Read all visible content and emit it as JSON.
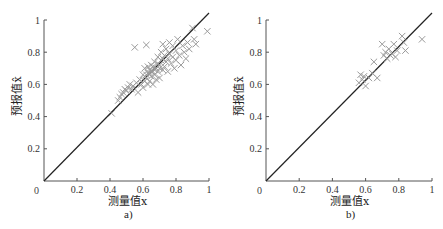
{
  "chart_data": [
    {
      "type": "scatter",
      "panel": "a)",
      "xlabel": "测量值x",
      "ylabel": "预报值x̂",
      "xlim": [
        0,
        1
      ],
      "ylim": [
        0,
        1
      ],
      "xticks": [
        "0",
        "0.2",
        "0.4",
        "0.6",
        "0.8",
        "1"
      ],
      "yticks": [
        "0.2",
        "0.4",
        "0.6",
        "0.8",
        "1"
      ],
      "reference_line": {
        "from": [
          0,
          0
        ],
        "to": [
          1,
          1
        ],
        "label": "y = x"
      },
      "marker": "x",
      "marker_color": "#9a9a9a",
      "grid": false,
      "points": [
        [
          0.41,
          0.42
        ],
        [
          0.45,
          0.5
        ],
        [
          0.46,
          0.52
        ],
        [
          0.47,
          0.54
        ],
        [
          0.48,
          0.55
        ],
        [
          0.49,
          0.57
        ],
        [
          0.5,
          0.56
        ],
        [
          0.51,
          0.58
        ],
        [
          0.52,
          0.6
        ],
        [
          0.53,
          0.57
        ],
        [
          0.54,
          0.59
        ],
        [
          0.55,
          0.83
        ],
        [
          0.56,
          0.61
        ],
        [
          0.57,
          0.55
        ],
        [
          0.58,
          0.63
        ],
        [
          0.59,
          0.6
        ],
        [
          0.6,
          0.58
        ],
        [
          0.6,
          0.66
        ],
        [
          0.61,
          0.62
        ],
        [
          0.61,
          0.7
        ],
        [
          0.62,
          0.845
        ],
        [
          0.62,
          0.64
        ],
        [
          0.63,
          0.67
        ],
        [
          0.63,
          0.6
        ],
        [
          0.64,
          0.69
        ],
        [
          0.64,
          0.62
        ],
        [
          0.65,
          0.72
        ],
        [
          0.65,
          0.65
        ],
        [
          0.66,
          0.68
        ],
        [
          0.66,
          0.6
        ],
        [
          0.67,
          0.74
        ],
        [
          0.67,
          0.66
        ],
        [
          0.68,
          0.7
        ],
        [
          0.68,
          0.63
        ],
        [
          0.69,
          0.77
        ],
        [
          0.69,
          0.68
        ],
        [
          0.7,
          0.72
        ],
        [
          0.7,
          0.64
        ],
        [
          0.71,
          0.8
        ],
        [
          0.71,
          0.75
        ],
        [
          0.72,
          0.69
        ],
        [
          0.72,
          0.85
        ],
        [
          0.73,
          0.78
        ],
        [
          0.73,
          0.71
        ],
        [
          0.74,
          0.82
        ],
        [
          0.74,
          0.74
        ],
        [
          0.75,
          0.76
        ],
        [
          0.75,
          0.68
        ],
        [
          0.76,
          0.86
        ],
        [
          0.76,
          0.79
        ],
        [
          0.77,
          0.73
        ],
        [
          0.78,
          0.84
        ],
        [
          0.78,
          0.77
        ],
        [
          0.79,
          0.7
        ],
        [
          0.8,
          0.81
        ],
        [
          0.8,
          0.75
        ],
        [
          0.81,
          0.88
        ],
        [
          0.82,
          0.78
        ],
        [
          0.83,
          0.72
        ],
        [
          0.84,
          0.84
        ],
        [
          0.85,
          0.8
        ],
        [
          0.86,
          0.76
        ],
        [
          0.87,
          0.86
        ],
        [
          0.88,
          0.82
        ],
        [
          0.9,
          0.95
        ],
        [
          0.91,
          0.88
        ],
        [
          0.92,
          0.85
        ],
        [
          0.99,
          0.93
        ],
        [
          0.62,
          0.66
        ],
        [
          0.64,
          0.67
        ],
        [
          0.66,
          0.71
        ],
        [
          0.67,
          0.69
        ],
        [
          0.69,
          0.73
        ],
        [
          0.7,
          0.7
        ],
        [
          0.72,
          0.76
        ],
        [
          0.63,
          0.71
        ],
        [
          0.65,
          0.68
        ]
      ]
    },
    {
      "type": "scatter",
      "panel": "b)",
      "xlabel": "测量值x",
      "ylabel": "预报值x̂",
      "xlim": [
        0,
        1
      ],
      "ylim": [
        0,
        1
      ],
      "xticks": [
        "0",
        "0.2",
        "0.4",
        "0.6",
        "0.8",
        "1"
      ],
      "yticks": [
        "0.2",
        "0.4",
        "0.6",
        "0.8",
        "1"
      ],
      "reference_line": {
        "from": [
          0,
          0
        ],
        "to": [
          1,
          1
        ],
        "label": "y = x"
      },
      "marker": "x",
      "marker_color": "#9a9a9a",
      "grid": false,
      "points": [
        [
          0.56,
          0.61
        ],
        [
          0.57,
          0.66
        ],
        [
          0.58,
          0.63
        ],
        [
          0.59,
          0.65
        ],
        [
          0.6,
          0.59
        ],
        [
          0.62,
          0.64
        ],
        [
          0.64,
          0.67
        ],
        [
          0.65,
          0.74
        ],
        [
          0.67,
          0.64
        ],
        [
          0.7,
          0.85
        ],
        [
          0.71,
          0.78
        ],
        [
          0.72,
          0.8
        ],
        [
          0.73,
          0.76
        ],
        [
          0.74,
          0.82
        ],
        [
          0.75,
          0.78
        ],
        [
          0.76,
          0.79
        ],
        [
          0.77,
          0.85
        ],
        [
          0.78,
          0.77
        ],
        [
          0.79,
          0.81
        ],
        [
          0.82,
          0.9
        ],
        [
          0.83,
          0.86
        ],
        [
          0.84,
          0.81
        ],
        [
          0.94,
          0.88
        ]
      ]
    }
  ],
  "figure": {
    "panels": [
      {
        "caption": "a)",
        "xlabel": "测量值x",
        "ylabel": "预报值x̂",
        "origin_label": "0"
      },
      {
        "caption": "b)",
        "xlabel": "测量值x",
        "ylabel": "预报值x̂",
        "origin_label": "0"
      }
    ]
  }
}
